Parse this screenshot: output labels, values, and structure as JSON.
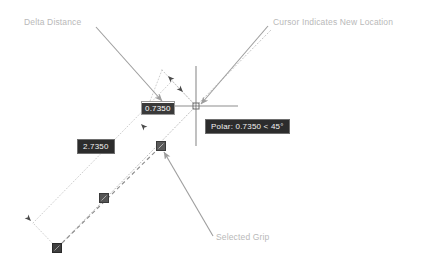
{
  "scene": {
    "title": "Dynamic Input Grip Editing",
    "background_color": "#ffffff"
  },
  "annotations": [
    {
      "id": "delta-distance",
      "text": "Delta Distance",
      "color": "#b9b9b9",
      "leader_from": [
        96,
        27
      ],
      "leader_to": [
        162,
        101
      ]
    },
    {
      "id": "cursor-location",
      "text": "Cursor Indicates New Location",
      "color": "#b9b9b9",
      "leader_from": [
        268,
        26
      ],
      "leader_to": [
        199,
        104
      ]
    },
    {
      "id": "selected-grip",
      "text": "Selected Grip",
      "color": "#b9b9b9",
      "leader_from": [
        213,
        236
      ],
      "leader_to": [
        163,
        151
      ]
    }
  ],
  "dynamic_input": {
    "name": "delta-distance-field",
    "value": "0.7350",
    "placeholder": "0.0000",
    "selected": true,
    "field_background": "#ffffff",
    "field_border_color": "#9a9a9a",
    "selection_background": "#3a3a3a",
    "selection_text_color": "#ffffff"
  },
  "dimension_chips": [
    {
      "id": "total-length",
      "label": "2.7350",
      "background": "#2c2c2c",
      "border": "#6e6e6e",
      "text_color": "#f2f2f2"
    }
  ],
  "polar_tooltip": {
    "name": "polar-tracking-tooltip",
    "text": "Polar: 0.7350 < 45°",
    "distance": "0.7350",
    "angle": "45°",
    "background": "#2c2c2c",
    "border": "#6e6e6e",
    "text_color": "#f2f2f2"
  },
  "cursor": {
    "name": "crosshair-cursor",
    "x": 196,
    "y": 106,
    "arm_length": 42,
    "pick_box": 5,
    "color": "#8d8d8d"
  },
  "grips": [
    {
      "id": "grip-selected",
      "x": 161,
      "y": 146,
      "size": 9,
      "state": "selected",
      "color": "#555555"
    },
    {
      "id": "grip-midpoint",
      "x": 104,
      "y": 198,
      "size": 9,
      "state": "warm",
      "color": "#555555"
    },
    {
      "id": "grip-endpoint",
      "x": 57,
      "y": 248,
      "size": 9,
      "state": "warm",
      "color": "#3a3a3a"
    }
  ],
  "geometry": {
    "original_line": {
      "from": [
        57,
        248
      ],
      "to": [
        161,
        146
      ],
      "style": "dashed",
      "color": "#8c8c8c"
    },
    "stretched_line": {
      "from": [
        57,
        248
      ],
      "to": [
        196,
        106
      ],
      "style": "dotted",
      "color": "#b5b5b5"
    },
    "offset_line": {
      "from": [
        33,
        223
      ],
      "to": [
        172,
        81
      ],
      "style": "dotted",
      "color": "#c2c2c2"
    },
    "extension_start": {
      "from": [
        57,
        248
      ],
      "to": [
        33,
        223
      ],
      "style": "dotted",
      "color": "#c2c2c2"
    },
    "extension_end": {
      "from": [
        196,
        106
      ],
      "to": [
        172,
        81
      ],
      "style": "dotted",
      "color": "#c2c2c2"
    },
    "polar_ray": {
      "from": [
        196,
        106
      ],
      "to": [
        268,
        33
      ],
      "style": "dotted",
      "color": "#bdbdbd"
    }
  },
  "dimension_arrows": [
    {
      "id": "arrow-delta-upper",
      "x": 165,
      "y": 73,
      "rotation": -135
    },
    {
      "id": "arrow-delta-lower",
      "x": 181,
      "y": 90,
      "rotation": 45
    },
    {
      "id": "arrow-length-upper",
      "x": 138,
      "y": 127,
      "rotation": -135
    },
    {
      "id": "arrow-length-lower",
      "x": 36,
      "y": 225,
      "rotation": 45
    }
  ]
}
